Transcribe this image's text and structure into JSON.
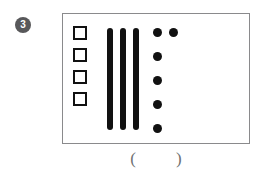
{
  "exercise": {
    "number_label": "3",
    "panel": {
      "squares": {
        "icon": "hollow-square",
        "count": 4,
        "items": [
          "square-1",
          "square-2",
          "square-3",
          "square-4"
        ]
      },
      "bars": {
        "icon": "vertical-bar",
        "count": 3,
        "items": [
          "bar-1",
          "bar-2",
          "bar-3"
        ]
      },
      "dots": {
        "icon": "filled-dot",
        "count": 6,
        "column_count": 5,
        "extra_count": 1,
        "items": [
          "dot-1",
          "dot-2",
          "dot-3",
          "dot-4",
          "dot-5",
          "dot-6"
        ]
      }
    },
    "answer": {
      "open_paren": "(",
      "close_paren": ")",
      "value": "",
      "placeholder": ""
    }
  },
  "colors": {
    "ink": "#111111",
    "badge_background": "#58585a",
    "badge_text": "#ffffff",
    "panel_border": "#8a8a8c",
    "paren_text": "#6f6f71",
    "page_background": "#ffffff"
  }
}
